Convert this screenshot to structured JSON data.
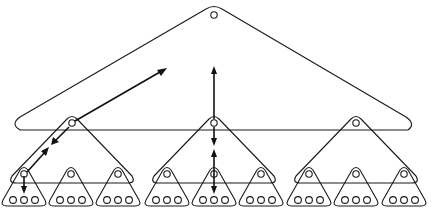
{
  "diagram": {
    "title": "Hierarchical nested triangle tree",
    "type": "tree-of-triangles",
    "levels": 3,
    "colors": {
      "stroke": "#1a1a1a",
      "background": "#ffffff",
      "node_fill": "#ffffff"
    },
    "root": {
      "label": "root",
      "children": 3
    },
    "mid_groups": [
      {
        "label": "left",
        "children": 3
      },
      {
        "label": "center",
        "children": 3
      },
      {
        "label": "right",
        "children": 3
      }
    ],
    "leaf_triangles": 9,
    "leaf_nodes_per_triangle": 3,
    "arrows": [
      {
        "name": "left-diagonal-up-to-root",
        "direction": "up-right"
      },
      {
        "name": "left-diagonal-down-to-leaf",
        "direction": "down-left"
      },
      {
        "name": "center-vertical-up-to-root",
        "direction": "up"
      },
      {
        "name": "center-vertical-down-to-leaf",
        "direction": "down"
      }
    ]
  }
}
